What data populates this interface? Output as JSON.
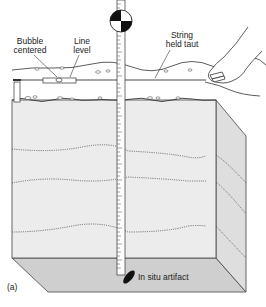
{
  "figure": {
    "panel_label": "(a)",
    "labels": {
      "bubble": [
        "Bubble",
        "centered"
      ],
      "line_level": [
        "Line",
        "level"
      ],
      "string": [
        "String",
        "held taut"
      ],
      "artifact": "In situ artifact"
    },
    "colors": {
      "front_face": "#e9e9e9",
      "side_face": "#dcdcdc",
      "bottom_face": "#cfcfcf",
      "line": "#333333",
      "stratum": "#555555"
    }
  }
}
